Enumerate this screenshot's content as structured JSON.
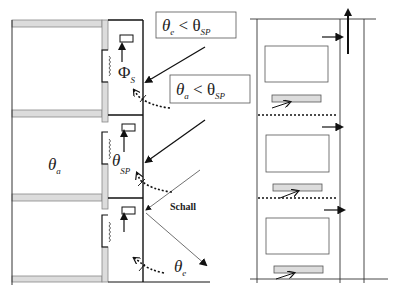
{
  "left_diagram": {
    "labels": {
      "theta_e_lt_theta_sp": {
        "main": "θ",
        "sub1": "e",
        "op": " < θ",
        "sub2": "SP"
      },
      "theta_a_lt_theta_sp": {
        "main": "θ",
        "sub1": "a",
        "op": " < θ",
        "sub2": "SP"
      },
      "phi_s": {
        "main": "Φ",
        "sub": "S"
      },
      "theta_sp": {
        "main": "θ",
        "sub": "SP"
      },
      "theta_a": {
        "main": "θ",
        "sub": "a"
      },
      "theta_e": {
        "main": "θ",
        "sub": "e"
      },
      "schall": "Schall"
    },
    "floors": 3
  },
  "right_diagram": {
    "floors": 3
  },
  "colors": {
    "line": "#111111",
    "wall_fill": "#dcdcdc",
    "wall_stroke": "#888888",
    "box_stroke": "#555555"
  }
}
